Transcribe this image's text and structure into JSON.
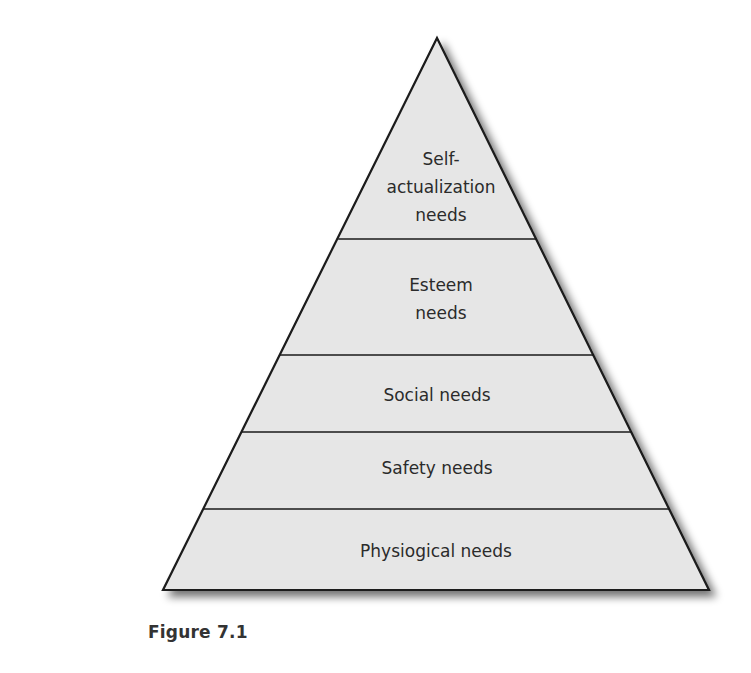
{
  "figure": {
    "type": "pyramid",
    "caption": "Figure 7.1",
    "fill_color": "#e6e6e6",
    "stroke_color": "#1a1a1a",
    "levels": [
      {
        "order": 5,
        "lines": [
          "Self-",
          "actualization",
          "needs"
        ]
      },
      {
        "order": 4,
        "lines": [
          "Esteem",
          "needs"
        ]
      },
      {
        "order": 3,
        "lines": [
          "Social needs"
        ]
      },
      {
        "order": 2,
        "lines": [
          "Safety needs"
        ]
      },
      {
        "order": 1,
        "lines": [
          "Physiogical needs"
        ]
      }
    ]
  }
}
